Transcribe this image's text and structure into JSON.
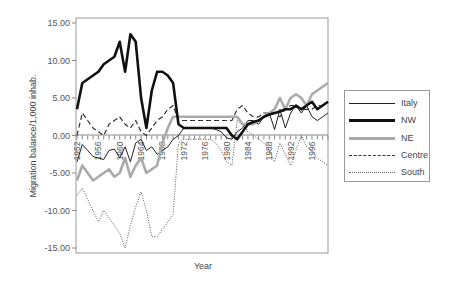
{
  "chart_data": {
    "type": "line",
    "title": "",
    "xlabel": "Year",
    "ylabel": "Migration balance/1,000 inhab.",
    "ylim": [
      -15,
      15
    ],
    "yticks": [
      "15.00",
      "10.00",
      "5.00",
      "0.00",
      "-5.00",
      "-10.00",
      "-15.00"
    ],
    "xticks": [
      "1952",
      "1956",
      "1960",
      "1964",
      "1968",
      "1972",
      "1976",
      "1980",
      "1984",
      "1988",
      "1992",
      "1996"
    ],
    "grid": false,
    "legend_position": "right",
    "x": [
      1952,
      1953,
      1954,
      1955,
      1956,
      1957,
      1958,
      1959,
      1960,
      1961,
      1962,
      1963,
      1964,
      1965,
      1966,
      1967,
      1968,
      1969,
      1970,
      1971,
      1972,
      1973,
      1974,
      1975,
      1976,
      1977,
      1978,
      1979,
      1980,
      1981,
      1982,
      1983,
      1984,
      1985,
      1986,
      1987,
      1988,
      1989,
      1990,
      1991,
      1992,
      1993,
      1994,
      1995,
      1996,
      1997,
      1998,
      1999
    ],
    "series": [
      {
        "name": "Italy",
        "style": "thin-solid",
        "color": "#222222",
        "values": [
          -3.5,
          -1.2,
          -2.0,
          -2.8,
          -3.0,
          -3.2,
          -2.0,
          -1.8,
          -3.0,
          -1.5,
          -3.5,
          -1.0,
          -0.5,
          -2.0,
          -1.5,
          -2.5,
          -2.0,
          -1.5,
          -0.5,
          0.0,
          1.0,
          1.0,
          1.0,
          1.0,
          1.0,
          1.0,
          0.8,
          0.5,
          -0.3,
          -0.5,
          0.5,
          1.0,
          2.0,
          2.0,
          1.5,
          2.5,
          3.0,
          0.8,
          3.5,
          1.0,
          3.0,
          4.0,
          3.0,
          4.0,
          2.5,
          2.0,
          2.5,
          3.0
        ]
      },
      {
        "name": "NW",
        "style": "thick-solid",
        "color": "#111111",
        "values": [
          3.5,
          7.0,
          7.5,
          8.0,
          8.5,
          9.5,
          10.0,
          10.5,
          12.5,
          8.5,
          13.5,
          12.5,
          5.0,
          1.0,
          6.0,
          8.5,
          8.5,
          8.0,
          7.0,
          1.5,
          1.0,
          1.0,
          1.0,
          1.0,
          1.0,
          1.0,
          1.0,
          1.0,
          1.0,
          0.0,
          -0.5,
          0.5,
          1.5,
          1.8,
          2.0,
          2.5,
          2.8,
          3.0,
          3.2,
          3.5,
          3.5,
          4.0,
          3.5,
          4.0,
          4.5,
          3.5,
          4.0,
          4.5
        ]
      },
      {
        "name": "NE",
        "style": "thick-gray",
        "color": "#aaaaaa",
        "values": [
          -6.0,
          -4.0,
          -5.0,
          -6.0,
          -5.5,
          -5.0,
          -4.5,
          -5.5,
          -5.0,
          -3.0,
          -5.5,
          -4.0,
          -3.0,
          -5.0,
          -4.5,
          -4.0,
          -1.0,
          1.0,
          2.5,
          2.5,
          2.5,
          2.5,
          2.5,
          2.5,
          2.5,
          2.5,
          2.5,
          2.5,
          2.5,
          2.5,
          2.5,
          1.5,
          1.5,
          1.5,
          2.0,
          2.5,
          3.0,
          3.5,
          5.0,
          3.5,
          5.0,
          5.5,
          5.0,
          4.0,
          5.5,
          6.0,
          6.5,
          7.0
        ]
      },
      {
        "name": "Centre",
        "style": "dashed",
        "color": "#333333",
        "values": [
          0.0,
          3.0,
          2.0,
          1.0,
          0.5,
          0.0,
          1.5,
          2.0,
          2.5,
          1.5,
          1.0,
          2.0,
          0.5,
          0.0,
          1.0,
          2.0,
          2.5,
          3.5,
          4.0,
          2.0,
          2.0,
          2.0,
          2.0,
          2.0,
          2.0,
          2.0,
          2.0,
          2.0,
          2.0,
          2.0,
          3.5,
          4.0,
          3.0,
          2.5,
          2.5,
          3.0,
          3.0,
          3.0,
          2.5,
          3.5,
          4.0,
          4.0,
          3.5,
          3.5,
          3.5,
          4.0,
          4.0,
          4.5
        ]
      },
      {
        "name": "South",
        "style": "dotted",
        "color": "#555555",
        "values": [
          -8.0,
          -7.0,
          -8.5,
          -10.0,
          -11.5,
          -10.0,
          -11.0,
          -12.0,
          -13.0,
          -15.0,
          -12.0,
          -9.5,
          -7.5,
          -10.0,
          -13.5,
          -13.5,
          -12.5,
          -11.5,
          -10.5,
          -1.0,
          -0.5,
          -0.5,
          -0.5,
          -0.5,
          -0.5,
          -0.5,
          -1.0,
          -2.0,
          -3.5,
          -4.0,
          2.0,
          1.5,
          0.5,
          0.0,
          -0.5,
          -1.0,
          -2.0,
          -3.5,
          -1.0,
          -2.5,
          -4.0,
          -2.0,
          0.0,
          -1.5,
          -2.0,
          -3.0,
          -3.5,
          -4.0
        ]
      }
    ]
  },
  "legend": {
    "items": [
      {
        "label": "Italy"
      },
      {
        "label": "NW"
      },
      {
        "label": "NE"
      },
      {
        "label": "Centre"
      },
      {
        "label": "South"
      }
    ]
  }
}
